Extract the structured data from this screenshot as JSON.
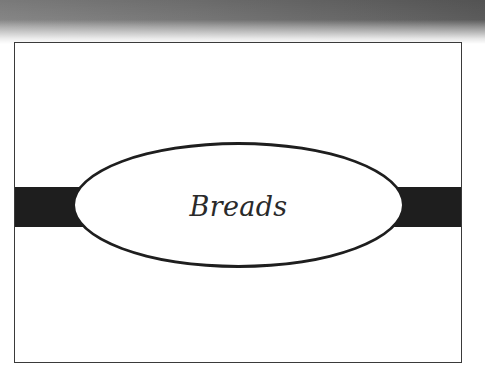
{
  "slide": {
    "title": "Breads"
  },
  "colors": {
    "band": "#1e1e1e",
    "ellipse_stroke": "#1e1e1e",
    "frame_border": "#3a3a3a",
    "background": "#ffffff",
    "gradient_dark": "#5e5e5e"
  }
}
